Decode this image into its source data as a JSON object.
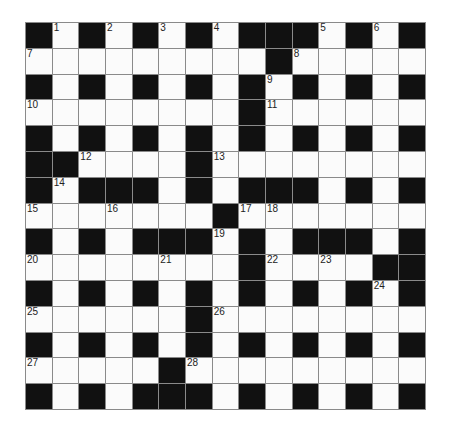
{
  "puzzle": {
    "rows": 15,
    "cols": 15,
    "colors": {
      "block": "#111111",
      "cell": "#fbfbfb",
      "gridline": "#8a8a8a",
      "number": "#222222"
    },
    "grid": [
      "#1#2#3#4###5#6#",
      "7........#8....",
      "#.#.#.#.#9#.#.#",
      "10.......#11.....",
      "#.#.#.#.#.#.#.#",
      "##12...#13.......",
      "#14###.#.###.#.#",
      "15..16...#17 18.....",
      "#.#.###19#.###.#",
      "20....21..#22.23.##",
      "#.#.#.#.#.#.#24#",
      "25.....#26.......",
      "#.#.#.#.#.#.#.#",
      "27....#28........",
      "#.#.###.#.#.#.#"
    ],
    "cells": [
      [
        "B",
        "1",
        "B",
        "2",
        "B",
        "3",
        "B",
        "4",
        "B",
        "B",
        "B",
        "5",
        "B",
        "6",
        "B"
      ],
      [
        "7",
        "",
        "",
        "",
        "",
        "",
        "",
        "",
        "",
        "B",
        "8",
        "",
        "",
        "",
        ""
      ],
      [
        "B",
        "",
        "B",
        "",
        "B",
        "",
        "B",
        "",
        "B",
        "9",
        "B",
        "",
        "B",
        "",
        "B"
      ],
      [
        "10",
        "",
        "",
        "",
        "",
        "",
        "",
        "",
        "B",
        "11",
        "",
        "",
        "",
        "",
        ""
      ],
      [
        "B",
        "",
        "B",
        "",
        "B",
        "",
        "B",
        "",
        "B",
        "",
        "B",
        "",
        "B",
        "",
        "B"
      ],
      [
        "B",
        "B",
        "12",
        "",
        "",
        "",
        "B",
        "13",
        "",
        "",
        "",
        "",
        "",
        "",
        ""
      ],
      [
        "B",
        "14",
        "B",
        "B",
        "B",
        "",
        "B",
        "",
        "B",
        "B",
        "B",
        "",
        "B",
        "",
        "B"
      ],
      [
        "15",
        "",
        "",
        "16",
        "",
        "",
        "",
        "B",
        "17",
        "18",
        "",
        "",
        "",
        "",
        ""
      ],
      [
        "B",
        "",
        "B",
        "",
        "B",
        "B",
        "B",
        "19",
        "B",
        "",
        "B",
        "B",
        "B",
        "",
        "B"
      ],
      [
        "20",
        "",
        "",
        "",
        "",
        "21",
        "",
        "",
        "B",
        "22",
        "",
        "23",
        "",
        "B",
        "B"
      ],
      [
        "B",
        "",
        "B",
        "",
        "B",
        "",
        "B",
        "",
        "B",
        "",
        "B",
        "",
        "B",
        "24",
        "B"
      ],
      [
        "25",
        "",
        "",
        "",
        "",
        "",
        "B",
        "26",
        "",
        "",
        "",
        "",
        "",
        "",
        ""
      ],
      [
        "B",
        "",
        "B",
        "",
        "B",
        "",
        "B",
        "",
        "B",
        "",
        "B",
        "",
        "B",
        "",
        "B"
      ],
      [
        "27",
        "",
        "",
        "",
        "",
        "B",
        "28",
        "",
        "",
        "",
        "",
        "",
        "",
        "",
        ""
      ],
      [
        "B",
        "",
        "B",
        "",
        "B",
        "B",
        "B",
        "",
        "B",
        "",
        "B",
        "",
        "B",
        "",
        "B"
      ]
    ]
  }
}
